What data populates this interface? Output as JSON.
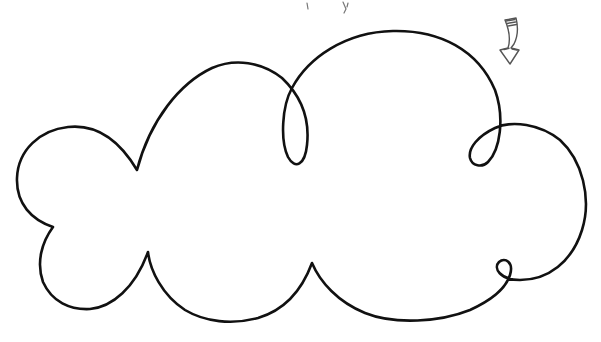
{
  "illustration": {
    "subject": "hand-drawn cloud outline",
    "caption": "Cloud outline drawing with a small downward arrow",
    "stroke_color": "#111111",
    "arrow_stroke_color": "#555555",
    "background_color": "#ffffff",
    "elements": [
      {
        "name": "cloud-outline",
        "description": "single continuous looping cloud line with five lobes and three loops"
      },
      {
        "name": "arrow",
        "description": "small hand-drawn curved arrow pointing down, top-right"
      },
      {
        "name": "top-marks",
        "description": "faint cropped pen marks at top edge"
      }
    ]
  }
}
